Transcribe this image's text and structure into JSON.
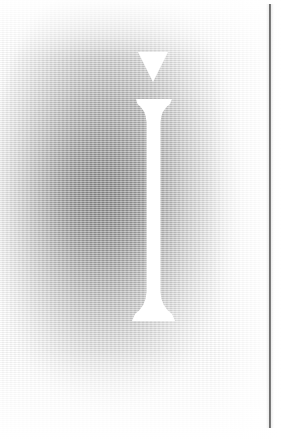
{
  "page": {
    "kind": "scanned-book-plate",
    "width": 281,
    "height": 440,
    "background_color": "#ffffff",
    "caption": ""
  },
  "artwork": {
    "name": "drop-cap-letter-i",
    "description": "Large white knocked-out serif letter i on a soft gray radial ink wash",
    "letter": "i",
    "letter_color": "#ffffff",
    "wash": {
      "name": "radial-gray-vignette",
      "darkest_color": "#969696",
      "mid_color": "#bdbdbd",
      "lightest_color": "#ffffff",
      "center_x_pct": 41,
      "center_y_pct": 45
    },
    "texture": {
      "name": "halftone-scan-screen",
      "type": "horizontal-line-screen"
    },
    "tittle": {
      "name": "triangular-tittle",
      "shape": "downward-triangle",
      "x": 138,
      "y": 52,
      "width": 30,
      "height": 30,
      "color": "#ffffff"
    },
    "stem": {
      "name": "serif-stem",
      "x": 148,
      "y": 98,
      "width": 13,
      "height": 222,
      "top_serif_width": 36,
      "bottom_serif_width": 44,
      "color": "#ffffff"
    }
  },
  "rule": {
    "name": "vertical-margin-rule",
    "color": "#3a3a3a",
    "x": 269,
    "y_top": 4,
    "y_bottom": 428,
    "thickness": 2
  }
}
